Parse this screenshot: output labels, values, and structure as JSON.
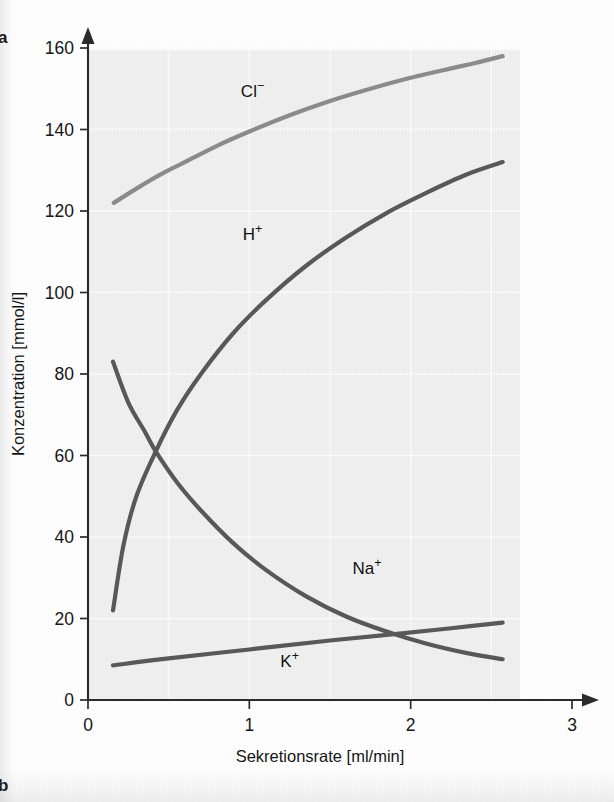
{
  "figure": {
    "panel_a_label": "a",
    "panel_b_label": "b"
  },
  "chart_data": {
    "type": "line",
    "title": "",
    "xlabel": "Sekretionsrate [ml/min]",
    "ylabel": "Konzentration [mmol/l]",
    "xlim": [
      0,
      3
    ],
    "ylim": [
      0,
      160
    ],
    "xticks": [
      "0",
      "1",
      "2",
      "3"
    ],
    "xtick_values": [
      0,
      1,
      2,
      3
    ],
    "yticks": [
      "0",
      "20",
      "40",
      "60",
      "80",
      "100",
      "120",
      "140",
      "160"
    ],
    "ytick_values": [
      0,
      20,
      40,
      60,
      80,
      100,
      120,
      140,
      160
    ],
    "grid": true,
    "legend_position": "inline-labels",
    "series": [
      {
        "name": "Cl⁻",
        "label_base": "Cl",
        "label_sup": "−",
        "color": "#8c8c8c",
        "stroke_width": 4.2,
        "label_x": 1.02,
        "label_y": 148,
        "x": [
          0.16,
          0.3,
          0.45,
          0.6,
          0.8,
          1.0,
          1.25,
          1.5,
          1.75,
          2.0,
          2.25,
          2.4,
          2.57
        ],
        "y": [
          122.0,
          125.5,
          129.0,
          132.0,
          136.0,
          139.5,
          143.5,
          147.0,
          150.0,
          152.7,
          155.0,
          156.3,
          158.0
        ]
      },
      {
        "name": "H⁺",
        "label_base": "H",
        "label_sup": "+",
        "color": "#595959",
        "stroke_width": 4.2,
        "label_x": 1.02,
        "label_y": 113,
        "x": [
          0.155,
          0.22,
          0.3,
          0.42,
          0.55,
          0.7,
          0.9,
          1.1,
          1.35,
          1.6,
          1.85,
          2.1,
          2.35,
          2.57
        ],
        "y": [
          22.0,
          38.0,
          50.0,
          61.0,
          71.0,
          80.0,
          90.0,
          98.0,
          106.5,
          113.5,
          119.5,
          124.5,
          129.0,
          132.0
        ]
      },
      {
        "name": "Na⁺",
        "label_base": "Na",
        "label_sup": "+",
        "color": "#595959",
        "stroke_width": 4.2,
        "label_x": 1.73,
        "label_y": 31,
        "x": [
          0.155,
          0.25,
          0.35,
          0.42,
          0.55,
          0.7,
          0.9,
          1.1,
          1.35,
          1.6,
          1.85,
          2.1,
          2.35,
          2.57
        ],
        "y": [
          83.0,
          73.0,
          66.0,
          61.0,
          53.5,
          46.5,
          38.5,
          32.0,
          25.5,
          20.5,
          16.8,
          13.8,
          11.5,
          10.0
        ]
      },
      {
        "name": "K⁺",
        "label_base": "K",
        "label_sup": "+",
        "color": "#595959",
        "stroke_width": 4.2,
        "label_x": 1.25,
        "label_y": 8,
        "x": [
          0.155,
          0.5,
          1.0,
          1.5,
          1.93,
          2.25,
          2.57
        ],
        "y": [
          8.5,
          10.2,
          12.4,
          14.6,
          16.3,
          17.6,
          19.0
        ]
      }
    ],
    "annotations": [
      {
        "name": "na-h-crossing",
        "x": 0.42,
        "y": 61
      },
      {
        "name": "na-k-crossing",
        "x": 1.93,
        "y": 16.3
      }
    ]
  }
}
